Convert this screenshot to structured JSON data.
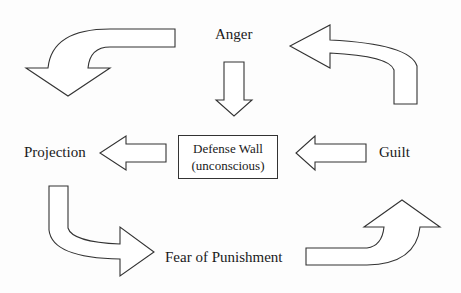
{
  "diagram": {
    "nodes": {
      "anger": "Anger",
      "projection": "Projection",
      "guilt": "Guilt",
      "fear": "Fear of Punishment",
      "defense_wall": {
        "line1": "Defense Wall",
        "line2": "(unconscious)"
      }
    },
    "edges": [
      {
        "from": "Anger",
        "to": "Defense Wall",
        "shape": "straight-down-arrow"
      },
      {
        "from": "Projection",
        "to": "Defense Wall",
        "shape": "straight-left-arrow",
        "direction": "points to Projection"
      },
      {
        "from": "Guilt",
        "to": "Defense Wall",
        "shape": "straight-left-arrow"
      },
      {
        "from": "Anger",
        "to": "Projection",
        "shape": "curved-arrow-left-down"
      },
      {
        "from": "Projection",
        "to": "Fear of Punishment",
        "shape": "curved-arrow-down-right"
      },
      {
        "from": "Fear of Punishment",
        "to": "Guilt",
        "shape": "curved-arrow-right-up"
      },
      {
        "from": "Guilt",
        "to": "Anger",
        "shape": "curved-arrow-up-left"
      }
    ],
    "colors": {
      "stroke": "#333333",
      "fill": "#ffffff",
      "text": "#1a1a1a"
    }
  }
}
